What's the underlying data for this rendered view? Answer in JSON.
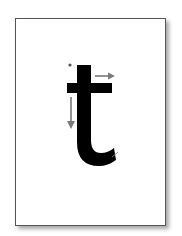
{
  "card": {
    "letter": "t",
    "description": "Letter formation guide card for lowercase t with stroke direction arrows"
  },
  "strokes": [
    {
      "order": 1,
      "direction": "down",
      "description": "Start at dot, pull stem down and curve right"
    },
    {
      "order": 2,
      "direction": "right",
      "description": "Cross horizontally left to right"
    }
  ],
  "colors": {
    "letter": "#000000",
    "arrow": "#7a7a7a",
    "start_dot": "#555555",
    "border": "#555555",
    "background": "#ffffff"
  }
}
